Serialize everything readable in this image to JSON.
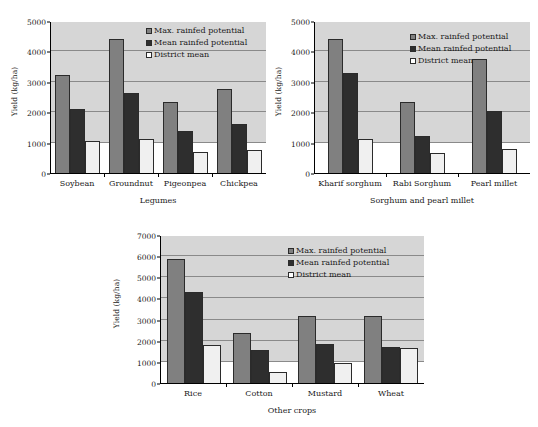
{
  "figure": {
    "series_names": [
      "Max. rainfed potential",
      "Mean rainfed potential",
      "District mean"
    ],
    "colors": {
      "max_rainfed_potential": "#808080",
      "mean_rainfed_potential": "#2e2e2e",
      "district_mean": "#f0f0f0",
      "plot_background": "#d6d6d6",
      "gridline": "#8a8a8a",
      "axis": "#000000"
    }
  },
  "chart_data": [
    {
      "type": "bar",
      "title": "",
      "xlabel": "Legumes",
      "ylabel": "Yield (kg/ha)",
      "categories": [
        "Soybean",
        "Groundnut",
        "Pigeonpea",
        "Chickpea"
      ],
      "series": [
        {
          "name": "Max. rainfed potential",
          "values": [
            3210,
            4420,
            2340,
            2770
          ]
        },
        {
          "name": "Mean rainfed potential",
          "values": [
            2090,
            2640,
            1390,
            1600
          ]
        },
        {
          "name": "District mean",
          "values": [
            1040,
            1130,
            680,
            770
          ]
        }
      ],
      "ylim": [
        0,
        5000
      ],
      "yticks": [
        0,
        1000,
        2000,
        3000,
        4000,
        5000
      ],
      "grid": true,
      "legend_position": "upper right"
    },
    {
      "type": "bar",
      "title": "",
      "xlabel": "Sorghum and pearl millet",
      "ylabel": "Yield (kg/ha)",
      "categories": [
        "Kharif sorghum",
        "Rabi Sorghum",
        "Pearl millet"
      ],
      "series": [
        {
          "name": "Max. rainfed potential",
          "values": [
            4420,
            2350,
            3750
          ]
        },
        {
          "name": "Mean rainfed potential",
          "values": [
            3300,
            1220,
            2050
          ]
        },
        {
          "name": "District mean",
          "values": [
            1130,
            670,
            800
          ]
        }
      ],
      "ylim": [
        0,
        5000
      ],
      "yticks": [
        0,
        1000,
        2000,
        3000,
        4000,
        5000
      ],
      "grid": true,
      "legend_position": "upper right"
    },
    {
      "type": "bar",
      "title": "",
      "xlabel": "Other crops",
      "ylabel": "Yield (kg/ha)",
      "categories": [
        "Rice",
        "Cotton",
        "Mustard",
        "Wheat"
      ],
      "series": [
        {
          "name": "Max. rainfed potential",
          "values": [
            5850,
            2350,
            3160,
            3180
          ]
        },
        {
          "name": "Mean rainfed potential",
          "values": [
            4320,
            1570,
            1860,
            1720
          ]
        },
        {
          "name": "District mean",
          "values": [
            1800,
            540,
            950,
            1640
          ]
        }
      ],
      "ylim": [
        0,
        7000
      ],
      "yticks": [
        0,
        1000,
        2000,
        3000,
        4000,
        5000,
        6000,
        7000
      ],
      "grid": true,
      "legend_position": "upper right"
    }
  ]
}
